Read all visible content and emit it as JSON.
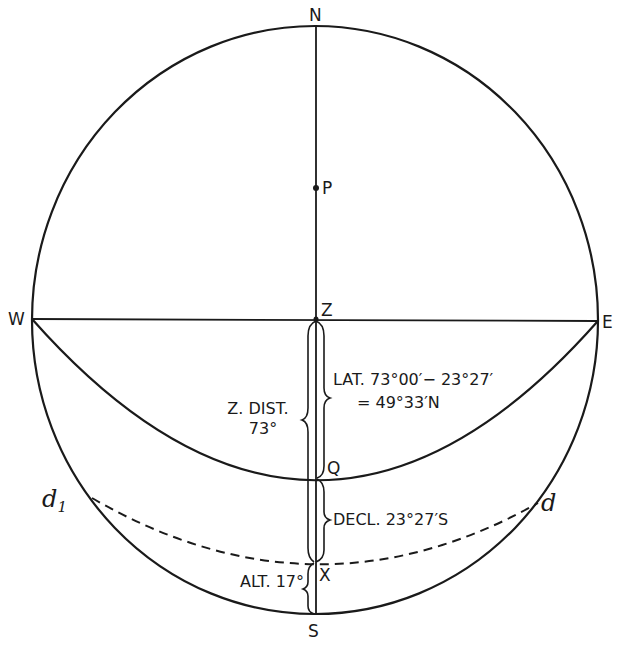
{
  "diagram": {
    "type": "celestial-sphere",
    "points": {
      "N": "N",
      "S": "S",
      "E": "E",
      "W": "W",
      "Z": "Z",
      "P": "P",
      "Q": "Q",
      "X": "X",
      "d": "d",
      "d1": "d",
      "d1_sub": "1"
    },
    "annotations": {
      "zenith_distance_line1": "Z. DIST.",
      "zenith_distance_line2": "73°",
      "latitude_line1": "LAT. 73°00′− 23°27′",
      "latitude_line2": "= 49°33′N",
      "declination": "DECL. 23°27′S",
      "altitude": "ALT. 17°"
    },
    "colors": {
      "line": "#1a1a1a",
      "background": "#ffffff"
    }
  }
}
